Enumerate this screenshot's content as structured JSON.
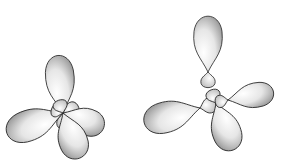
{
  "figure": {
    "colors": {
      "stroke": "#222222",
      "shade": "#888888",
      "background": "#ffffff"
    },
    "left_group": {
      "name": "combined-hybrid-orbitals",
      "center": [
        63,
        113
      ],
      "lobes": [
        {
          "angle": -95,
          "length": 60,
          "width": 28
        },
        {
          "angle": 160,
          "length": 62,
          "width": 30
        },
        {
          "angle": 20,
          "length": 45,
          "width": 26
        },
        {
          "angle": 70,
          "length": 50,
          "width": 28
        }
      ]
    },
    "right_group": {
      "name": "separated-hybrid-orbitals",
      "orbitals": [
        {
          "cx": 208,
          "cy": 72,
          "angle": -90,
          "length": 58,
          "width": 28
        },
        {
          "cx": 200,
          "cy": 108,
          "angle": 165,
          "length": 60,
          "width": 30
        },
        {
          "cx": 216,
          "cy": 103,
          "angle": 70,
          "length": 52,
          "width": 28
        },
        {
          "cx": 228,
          "cy": 100,
          "angle": -10,
          "length": 48,
          "width": 24
        }
      ]
    }
  }
}
